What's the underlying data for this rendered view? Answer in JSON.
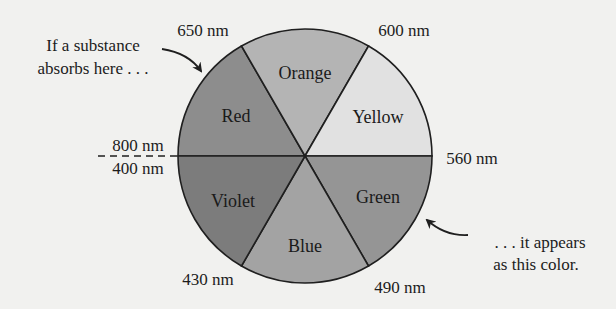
{
  "diagram": {
    "type": "color-wheel",
    "center": [
      305,
      156
    ],
    "radius": 127,
    "segments": [
      {
        "name": "Red",
        "fill": "#8d8d8d",
        "label_pos": [
          236,
          116
        ]
      },
      {
        "name": "Orange",
        "fill": "#b4b4b4",
        "label_pos": [
          305,
          72
        ]
      },
      {
        "name": "Yellow",
        "fill": "#e1e1e1",
        "label_pos": [
          378,
          122
        ]
      },
      {
        "name": "Green",
        "fill": "#959595",
        "label_pos": [
          378,
          203
        ]
      },
      {
        "name": "Blue",
        "fill": "#a3a3a3",
        "label_pos": [
          305,
          252
        ]
      },
      {
        "name": "Violet",
        "fill": "#7c7c7c",
        "label_pos": [
          233,
          205
        ]
      }
    ],
    "boundaries": [
      {
        "label": "650 nm",
        "pos": [
          196,
          38
        ]
      },
      {
        "label": "600 nm",
        "pos": [
          401,
          38
        ]
      },
      {
        "label": "560 nm",
        "pos": [
          441,
          163
        ]
      },
      {
        "label": "490 nm",
        "pos": [
          401,
          293
        ]
      },
      {
        "label": "430 nm",
        "pos": [
          208,
          285
        ]
      },
      {
        "label": "800 nm",
        "pos": [
          141,
          149
        ]
      },
      {
        "label": "400 nm",
        "pos": [
          141,
          176
        ]
      }
    ],
    "annotations": {
      "absorbs": {
        "line1": "If a substance",
        "line2": "absorbs here . . ."
      },
      "appears": {
        "line1": ". . . it appears",
        "line2": "as this color."
      }
    },
    "colors": {
      "background": "#f1f1ef",
      "stroke": "#1f1f1f",
      "text": "#1c1c1c"
    }
  }
}
